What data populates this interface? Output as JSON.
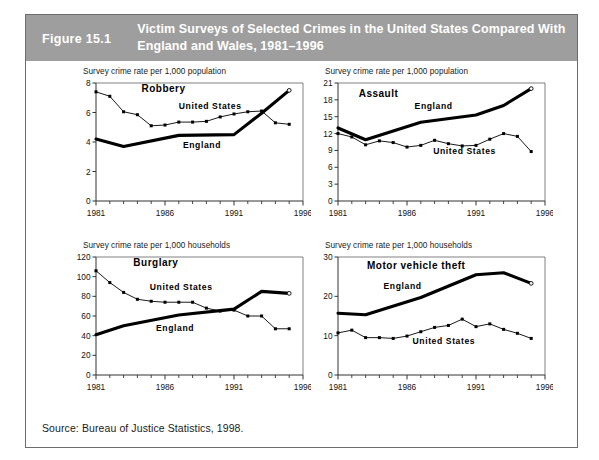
{
  "figure": {
    "number": "Figure 15.1",
    "title": "Victim Surveys of Selected Crimes in the United States Compared With England and Wales, 1981–1996",
    "source": "Source: Bureau of Justice Statistics, 1998.",
    "header_bg": "#9e9e9e",
    "header_fg": "#ffffff",
    "border_color": "#6d6d6d"
  },
  "chart_data": [
    {
      "id": "robbery",
      "type": "line",
      "title": "Robbery",
      "ylabel": "Survey crime rate per 1,000 population",
      "xlabel": "",
      "xlim": [
        1981,
        1996
      ],
      "ylim": [
        0,
        8
      ],
      "yticks": [
        0,
        2,
        4,
        6,
        8
      ],
      "xticks": [
        1981,
        1986,
        1991,
        1996
      ],
      "x_minor_ticks": [
        1982,
        1983,
        1984,
        1985,
        1987,
        1988,
        1989,
        1990,
        1992,
        1993,
        1994,
        1995
      ],
      "grid": false,
      "legend": "inline-annotations",
      "series": [
        {
          "name": "United States",
          "style": "thin-with-square-markers",
          "x": [
            1981,
            1982,
            1983,
            1984,
            1985,
            1986,
            1987,
            1988,
            1989,
            1990,
            1991,
            1992,
            1993,
            1994,
            1995
          ],
          "values": [
            7.4,
            7.1,
            6.05,
            5.85,
            5.1,
            5.15,
            5.35,
            5.35,
            5.4,
            5.7,
            5.9,
            6.05,
            6.1,
            5.3,
            5.2
          ]
        },
        {
          "name": "England",
          "style": "thick-line",
          "x": [
            1981,
            1983,
            1987,
            1991,
            1993,
            1995
          ],
          "values": [
            4.2,
            3.7,
            4.45,
            4.5,
            5.95,
            7.5
          ]
        }
      ]
    },
    {
      "id": "assault",
      "type": "line",
      "title": "Assault",
      "ylabel": "Survey crime rate per 1,000 population",
      "xlabel": "",
      "xlim": [
        1981,
        1996
      ],
      "ylim": [
        0,
        21
      ],
      "yticks": [
        0,
        3,
        6,
        9,
        12,
        15,
        18,
        21
      ],
      "xticks": [
        1981,
        1986,
        1991,
        1996
      ],
      "x_minor_ticks": [
        1982,
        1983,
        1984,
        1985,
        1987,
        1988,
        1989,
        1990,
        1992,
        1993,
        1994,
        1995
      ],
      "grid": false,
      "legend": "inline-annotations",
      "series": [
        {
          "name": "England",
          "style": "thick-line",
          "x": [
            1981,
            1983,
            1987,
            1991,
            1993,
            1995
          ],
          "values": [
            13.0,
            10.9,
            14.0,
            15.3,
            17.0,
            20.0
          ]
        },
        {
          "name": "United States",
          "style": "thin-with-square-markers",
          "x": [
            1981,
            1982,
            1983,
            1984,
            1985,
            1986,
            1987,
            1988,
            1989,
            1990,
            1991,
            1992,
            1993,
            1994,
            1995
          ],
          "values": [
            12.0,
            11.4,
            10.0,
            10.7,
            10.4,
            9.6,
            9.9,
            10.8,
            10.2,
            9.8,
            9.9,
            11.0,
            12.0,
            11.5,
            8.8
          ]
        }
      ]
    },
    {
      "id": "burglary",
      "type": "line",
      "title": "Burglary",
      "ylabel": "Survey crime rate per 1,000 households",
      "xlabel": "",
      "xlim": [
        1981,
        1996
      ],
      "ylim": [
        0,
        120
      ],
      "yticks": [
        0,
        20,
        40,
        60,
        80,
        100,
        120
      ],
      "xticks": [
        1981,
        1986,
        1991,
        1996
      ],
      "x_minor_ticks": [
        1982,
        1983,
        1984,
        1985,
        1987,
        1988,
        1989,
        1990,
        1992,
        1993,
        1994,
        1995
      ],
      "grid": false,
      "legend": "inline-annotations",
      "series": [
        {
          "name": "United States",
          "style": "thin-with-square-markers",
          "x": [
            1981,
            1982,
            1983,
            1984,
            1985,
            1986,
            1987,
            1988,
            1989,
            1990,
            1991,
            1992,
            1993,
            1994,
            1995
          ],
          "values": [
            106,
            94,
            84,
            77,
            75,
            74,
            74,
            74,
            68,
            65,
            66,
            60,
            60,
            47,
            47
          ]
        },
        {
          "name": "England",
          "style": "thick-line",
          "x": [
            1981,
            1983,
            1987,
            1991,
            1993,
            1995
          ],
          "values": [
            41,
            50,
            61,
            67,
            85,
            83
          ]
        }
      ]
    },
    {
      "id": "motor-vehicle-theft",
      "type": "line",
      "title": "Motor vehicle theft",
      "ylabel": "Survey crime rate per 1,000 households",
      "xlabel": "",
      "xlim": [
        1981,
        1996
      ],
      "ylim": [
        0,
        30
      ],
      "yticks": [
        0,
        10,
        20,
        30
      ],
      "xticks": [
        1981,
        1986,
        1991,
        1996
      ],
      "x_minor_ticks": [
        1982,
        1983,
        1984,
        1985,
        1987,
        1988,
        1989,
        1990,
        1992,
        1993,
        1994,
        1995
      ],
      "grid": false,
      "legend": "inline-annotations",
      "series": [
        {
          "name": "England",
          "style": "thick-line",
          "x": [
            1981,
            1983,
            1987,
            1991,
            1993,
            1995
          ],
          "values": [
            15.7,
            15.3,
            19.7,
            25.5,
            26.0,
            23.3
          ]
        },
        {
          "name": "United States",
          "style": "thin-with-square-markers",
          "x": [
            1981,
            1982,
            1983,
            1984,
            1985,
            1986,
            1987,
            1988,
            1989,
            1990,
            1991,
            1992,
            1993,
            1994,
            1995
          ],
          "values": [
            10.7,
            11.4,
            9.5,
            9.5,
            9.3,
            9.9,
            11.0,
            12.1,
            12.6,
            14.2,
            12.3,
            13.0,
            11.6,
            10.6,
            9.3
          ]
        }
      ]
    }
  ]
}
